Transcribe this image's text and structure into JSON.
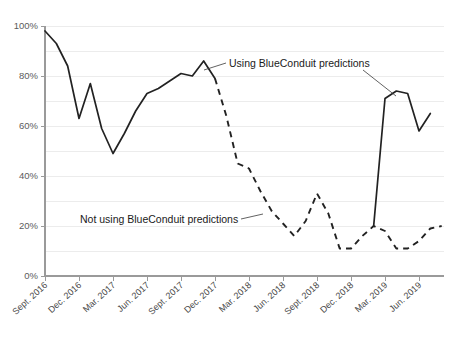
{
  "chart_data": {
    "type": "line",
    "title": "",
    "subtitle": "",
    "xlabel": "",
    "ylabel": "",
    "ylim": [
      0,
      100
    ],
    "yticks": [
      0,
      20,
      40,
      60,
      80,
      100
    ],
    "ytick_labels": [
      "0%",
      "20%",
      "40%",
      "60%",
      "80%",
      "100%"
    ],
    "grid": true,
    "grid_interval": 10,
    "legend_position": "inline-annotation",
    "xtick_labels": [
      "Sept. 2016",
      "Dec. 2016",
      "Mar. 2017",
      "Jun. 2017",
      "Sept. 2017",
      "Dec. 2017",
      "Mar. 2018",
      "Jun. 2018",
      "Sept. 2018",
      "Dec. 2018",
      "Mar. 2019",
      "Jun. 2019"
    ],
    "x": [
      "Sept. 2016",
      "Oct. 2016",
      "Nov. 2016",
      "Dec. 2016",
      "Jan. 2017",
      "Feb. 2017",
      "Mar. 2017",
      "Apr. 2017",
      "May 2017",
      "Jun. 2017",
      "Jul. 2017",
      "Aug. 2017",
      "Sept. 2017",
      "Oct. 2017",
      "Nov. 2017",
      "Dec. 2017",
      "Jan. 2018",
      "Feb. 2018",
      "Mar. 2018",
      "Apr. 2018",
      "May 2018",
      "Jun. 2018",
      "Jul. 2018",
      "Aug. 2018",
      "Sept. 2018",
      "Oct. 2018",
      "Nov. 2018",
      "Dec. 2018",
      "Jan. 2019",
      "Feb. 2019",
      "Mar. 2019",
      "Apr. 2019",
      "May 2019",
      "Jun. 2019",
      "Jul. 2019"
    ],
    "series": [
      {
        "name": "Using BlueConduit predictions",
        "style": "solid",
        "color": "#222222",
        "segments": [
          {
            "from": "Sept. 2016",
            "to": "Dec. 2017",
            "values": [
              98,
              93,
              84,
              63,
              77,
              59,
              49,
              57,
              66,
              73,
              75,
              78,
              81,
              80,
              86,
              79
            ]
          },
          {
            "from": "Feb. 2019",
            "to": "Jul. 2019",
            "values": [
              20,
              71,
              74,
              73,
              58,
              65
            ]
          }
        ]
      },
      {
        "name": "Not using BlueConduit predictions",
        "style": "dashed",
        "color": "#222222",
        "segments": [
          {
            "from": "Dec. 2017",
            "to": "Feb. 2019",
            "values": [
              79,
              64,
              45,
              43,
              34,
              26,
              21,
              16,
              22,
              33,
              25,
              11,
              11,
              16,
              20,
              18,
              11,
              11,
              14,
              19,
              20
            ]
          }
        ]
      }
    ],
    "annotations": [
      {
        "id": "annot-using",
        "text": "Using BlueConduit predictions",
        "points_to": [
          "first solid segment near Nov. 2017",
          "second solid segment near Apr. 2019"
        ]
      },
      {
        "id": "annot-not-using",
        "text": "Not using BlueConduit predictions",
        "points_to": [
          "dashed segment near Apr. 2018"
        ]
      }
    ]
  }
}
